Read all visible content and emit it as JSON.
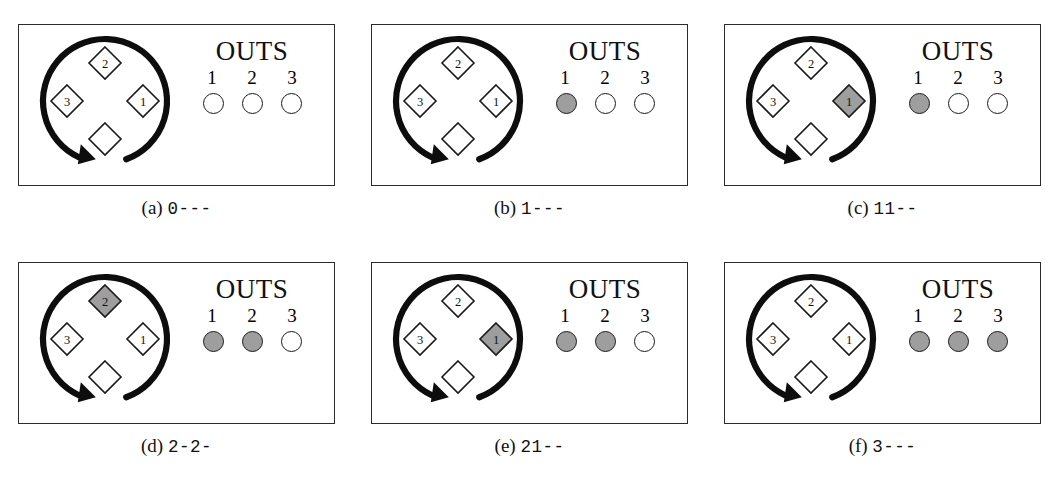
{
  "figure": {
    "type": "baseball-game-state-diagram",
    "panel_count": 6,
    "outs_label": "OUTS",
    "out_numbers": [
      "1",
      "2",
      "3"
    ],
    "base_labels": [
      "",
      "1",
      "2",
      "3"
    ],
    "colors": {
      "fill_gray": "#9e9e9e",
      "outline": "#1a1a1a",
      "frame": "#2b2b2b",
      "background": "#ffffff"
    }
  },
  "panels": [
    {
      "id": "panel-a",
      "caption_label": "(a)",
      "caption_code": "0---",
      "outs": 0,
      "out_states": [
        false,
        false,
        false
      ],
      "bases": {
        "home": false,
        "first": false,
        "second": false,
        "third": false
      },
      "base_labels": {
        "home": "",
        "first": "1",
        "second": "2",
        "third": "3"
      }
    },
    {
      "id": "panel-b",
      "caption_label": "(b)",
      "caption_code": "1---",
      "outs": 1,
      "out_states": [
        true,
        false,
        false
      ],
      "bases": {
        "home": false,
        "first": false,
        "second": false,
        "third": false
      },
      "base_labels": {
        "home": "",
        "first": "1",
        "second": "2",
        "third": "3"
      }
    },
    {
      "id": "panel-c",
      "caption_label": "(c)",
      "caption_code": "11--",
      "outs": 1,
      "out_states": [
        true,
        false,
        false
      ],
      "bases": {
        "home": false,
        "first": true,
        "second": false,
        "third": false
      },
      "base_labels": {
        "home": "",
        "first": "1",
        "second": "2",
        "third": "3"
      }
    },
    {
      "id": "panel-d",
      "caption_label": "(d)",
      "caption_code": "2-2-",
      "outs": 2,
      "out_states": [
        true,
        true,
        false
      ],
      "bases": {
        "home": false,
        "first": false,
        "second": true,
        "third": false
      },
      "base_labels": {
        "home": "",
        "first": "1",
        "second": "2",
        "third": "3"
      }
    },
    {
      "id": "panel-e",
      "caption_label": "(e)",
      "caption_code": "21--",
      "outs": 2,
      "out_states": [
        true,
        true,
        false
      ],
      "bases": {
        "home": false,
        "first": true,
        "second": false,
        "third": false
      },
      "base_labels": {
        "home": "",
        "first": "1",
        "second": "2",
        "third": "3"
      }
    },
    {
      "id": "panel-f",
      "caption_label": "(f)",
      "caption_code": "3---",
      "outs": 3,
      "out_states": [
        true,
        true,
        true
      ],
      "bases": {
        "home": false,
        "first": false,
        "second": false,
        "third": false
      },
      "base_labels": {
        "home": "",
        "first": "1",
        "second": "2",
        "third": "3"
      }
    }
  ]
}
